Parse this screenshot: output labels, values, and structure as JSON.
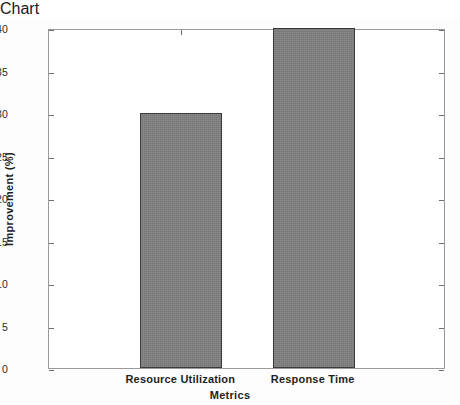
{
  "chart_data": {
    "type": "bar",
    "title": "",
    "subtitle": "",
    "categories": [
      "Resource Utilization",
      "Response Time"
    ],
    "values": [
      30,
      40
    ],
    "series": [
      {
        "name": "Improvement",
        "values": [
          30,
          40
        ]
      }
    ],
    "xlabel": "Metrics",
    "ylabel": "Improvement (%)",
    "ylim": [
      0,
      40
    ],
    "xlim": [
      0,
      3
    ],
    "ytick_labels": [
      "0",
      "5",
      "10",
      "15",
      "20",
      "25",
      "30",
      "35",
      "40"
    ],
    "ytick_values": [
      0,
      5,
      10,
      15,
      20,
      25,
      30,
      35,
      40
    ],
    "grid": false,
    "legend": null,
    "legend_position": "none",
    "bar_color": "#808080",
    "bar_edge_color": "#3a3a3a",
    "axis_color": "#9a9a9a",
    "background_color": "#ffffff",
    "annotations": []
  }
}
